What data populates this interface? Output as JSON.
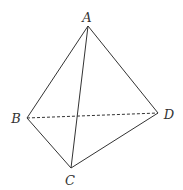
{
  "diagram": {
    "type": "tetrahedron",
    "vertices": {
      "A": {
        "label": "A",
        "x": 88,
        "y": 26,
        "label_x": 87,
        "label_y": 17
      },
      "B": {
        "label": "B",
        "x": 27,
        "y": 118,
        "label_x": 16,
        "label_y": 118
      },
      "C": {
        "label": "C",
        "x": 71,
        "y": 168,
        "label_x": 70,
        "label_y": 180
      },
      "D": {
        "label": "D",
        "x": 158,
        "y": 113,
        "label_x": 169,
        "label_y": 114
      }
    },
    "edges": [
      {
        "from": "A",
        "to": "B",
        "style": "solid"
      },
      {
        "from": "A",
        "to": "C",
        "style": "solid"
      },
      {
        "from": "A",
        "to": "D",
        "style": "solid"
      },
      {
        "from": "B",
        "to": "C",
        "style": "solid"
      },
      {
        "from": "C",
        "to": "D",
        "style": "solid"
      },
      {
        "from": "B",
        "to": "D",
        "style": "dashed"
      }
    ],
    "line_color": "#333333"
  }
}
